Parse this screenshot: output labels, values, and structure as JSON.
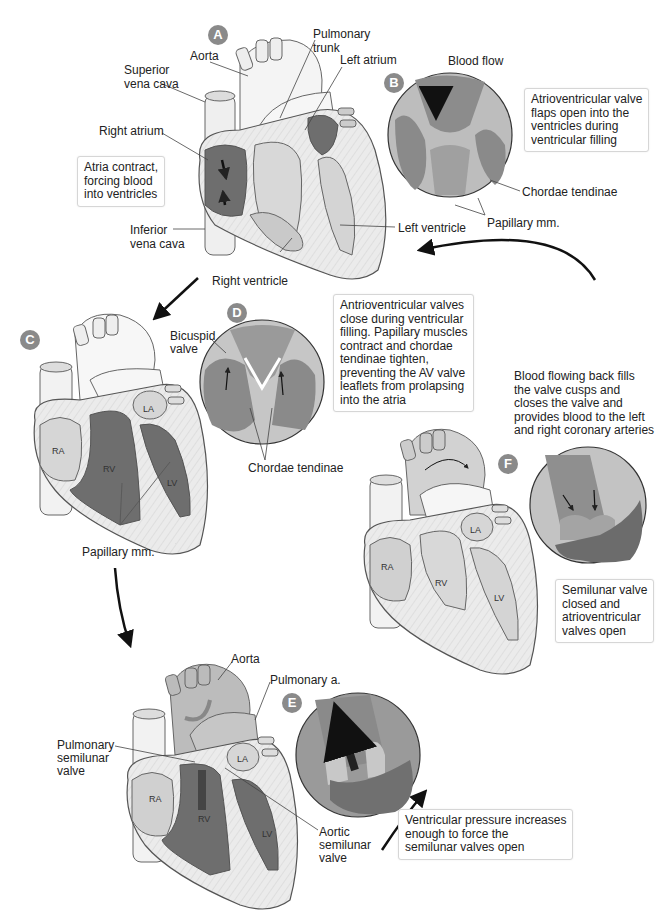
{
  "colors": {
    "badge": "#8a8a8a",
    "blood_dark": "#6e6e6e",
    "tissue_light": "#d9d9d9",
    "myocardium": "#ececec",
    "outline": "#555555",
    "arrow": "#111111"
  },
  "panels": {
    "A": {
      "badge": "A",
      "labels": {
        "aorta": "Aorta",
        "pulmonary_trunk": "Pulmonary\ntrunk",
        "left_atrium": "Left atrium",
        "superior_vena_cava": "Superior\nvena cava",
        "right_atrium": "Right atrium",
        "inferior_vena_cava": "Inferior\nvena cava",
        "left_ventricle": "Left ventricle",
        "right_ventricle": "Right ventricle"
      },
      "caption": "Atria contract,\nforcing blood\ninto ventricles"
    },
    "B": {
      "badge": "B",
      "title": "Blood flow",
      "labels": {
        "chordae_tendinae": "Chordae tendinae",
        "papillary": "Papillary mm."
      },
      "caption": "Atrioventricular valve\nflaps open into the\nventricles during\nventricular filling"
    },
    "C": {
      "badge": "C",
      "chambers": {
        "ra": "RA",
        "rv": "RV",
        "la": "LA",
        "lv": "LV"
      },
      "labels": {
        "papillary": "Papillary mm."
      }
    },
    "D": {
      "badge": "D",
      "labels": {
        "bicuspid": "Bicuspid\nvalve",
        "chordae_tendinae": "Chordae tendinae"
      },
      "caption": "Antrioventricular valves\nclose during ventricular\nfilling. Papillary muscles\ncontract and chordae\ntendinae tighten,\npreventing the AV valve\nleaflets from prolapsing\ninto the atria"
    },
    "E": {
      "badge": "E",
      "chambers": {
        "ra": "RA",
        "rv": "RV",
        "la": "LA",
        "lv": "LV"
      },
      "labels": {
        "aorta": "Aorta",
        "pulmonary_a": "Pulmonary a.",
        "pulmonary_semilunar": "Pulmonary\nsemilunar\nvalve",
        "aortic_semilunar": "Aortic\nsemilunar\nvalve"
      },
      "caption": "Ventricular pressure increases\nenough to force the\nsemilunar valves open"
    },
    "F": {
      "badge": "F",
      "chambers": {
        "ra": "RA",
        "rv": "RV",
        "la": "LA",
        "lv": "LV"
      },
      "top_text": "Blood flowing back fills\nthe valve cusps and\ncloses the valve and\nprovides blood to the left\nand right coronary arteries",
      "caption": "Semilunar valve\nclosed and\natrioventricular\nvalves open"
    }
  }
}
